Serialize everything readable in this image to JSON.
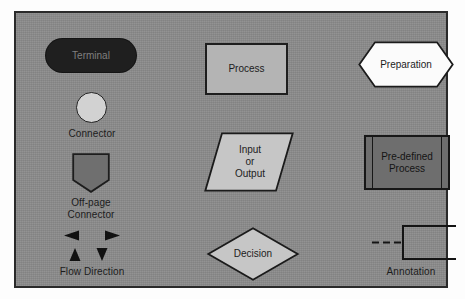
{
  "figure": {
    "background_color": "#8b8b8b",
    "border_color": "#2a2a2a",
    "page_color": "#fdfdfd"
  },
  "symbols": {
    "terminal": {
      "name": "Terminal",
      "inner_label": "Terminal",
      "shape": "stadium",
      "fill": "#1f1f1f",
      "text_color": "#7f7f7f"
    },
    "connector": {
      "name": "Connector",
      "caption": "Connector",
      "shape": "circle",
      "fill": "#d2d2d2",
      "stroke": "#232323"
    },
    "offpage_connector": {
      "name": "Off-page Connector",
      "caption": "Off-page\nConnector",
      "shape": "pentagon-down",
      "fill": "#6f6f6f",
      "stroke": "#1d1d1d"
    },
    "flow_direction": {
      "name": "Flow Direction",
      "caption": "Flow Direction",
      "shape": "arrowheads",
      "arrows": [
        "left",
        "right",
        "up",
        "down"
      ],
      "fill": "#111111"
    },
    "process": {
      "name": "Process",
      "inner_label": "Process",
      "shape": "rectangle",
      "fill": "#b4b4b4",
      "stroke": "#1e1e1e"
    },
    "preparation": {
      "name": "Preparation",
      "inner_label": "Preparation",
      "shape": "hexagon",
      "fill": "#fbfbfb",
      "stroke": "#1b1b1b"
    },
    "input_output": {
      "name": "Input or Output",
      "inner_label": "Input\nor\nOutput",
      "shape": "parallelogram",
      "fill": "#c6c6c6",
      "stroke": "#1b1b1b"
    },
    "predefined_process": {
      "name": "Pre-defined Process",
      "inner_label": "Pre-defined\nProcess",
      "shape": "rectangle-with-side-bars",
      "fill": "#6e6e6e",
      "stroke": "#171717"
    },
    "decision": {
      "name": "Decision",
      "inner_label": "Decision",
      "shape": "diamond",
      "fill": "#c6c6c6",
      "stroke": "#1b1b1b"
    },
    "annotation": {
      "name": "Annotation",
      "caption": "Annotation",
      "shape": "bracket-with-dashed-line",
      "stroke": "#141414"
    }
  }
}
